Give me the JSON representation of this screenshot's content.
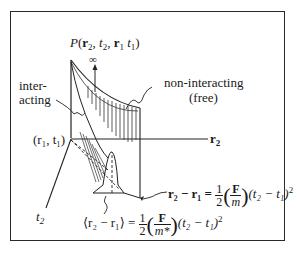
{
  "figure": {
    "title_func": "P",
    "title_args": [
      "r",
      "2",
      "t",
      "2",
      "r",
      "1",
      "t",
      "1"
    ],
    "infinity_label": "∞",
    "label_interacting_line1": "inter-",
    "label_interacting_line2": "acting",
    "label_noninteracting_line1": "non-interacting",
    "label_noninteracting_line2": "(free)",
    "origin_label": "(r₁, t₁)",
    "axis_r2": "r",
    "axis_r2_sub": "2",
    "axis_t2": "t",
    "axis_t2_sub": "2",
    "eq_free": {
      "lhs": "r₂ − r₁ =",
      "coef_num": "1",
      "coef_den": "2",
      "force": "F",
      "mass": "m",
      "time": "(t₂ − t₁)",
      "power": "2"
    },
    "eq_interacting": {
      "lhs": "⟨r₂ − r₁⟩ =",
      "coef_num": "1",
      "coef_den": "2",
      "force": "F",
      "mass": "m*",
      "time": "(t₂ − t₁)",
      "power": "2"
    }
  }
}
